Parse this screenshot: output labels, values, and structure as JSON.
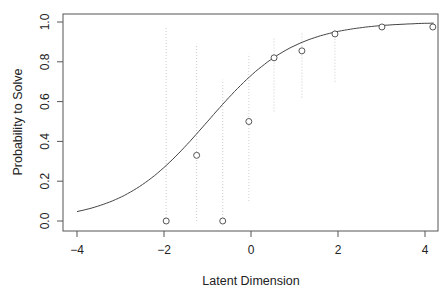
{
  "chart_data": {
    "type": "scatter",
    "title": "",
    "xlabel": "Latent Dimension",
    "ylabel": "Probability to Solve",
    "xlim": [
      -4.3,
      4.3
    ],
    "ylim": [
      -0.04,
      1.04
    ],
    "xticks": [
      -4,
      -2,
      0,
      2,
      4
    ],
    "xtick_labels": [
      "−4",
      "−2",
      "0",
      "2",
      "4"
    ],
    "yticks": [
      0.0,
      0.2,
      0.4,
      0.6,
      0.8,
      1.0
    ],
    "ytick_labels": [
      "0.0",
      "0.2",
      "0.4",
      "0.6",
      "0.8",
      "1.0"
    ],
    "grid": false,
    "legend": null,
    "points": [
      {
        "x": -1.95,
        "y": 0.0
      },
      {
        "x": -1.25,
        "y": 0.33
      },
      {
        "x": -0.65,
        "y": 0.0
      },
      {
        "x": -0.05,
        "y": 0.5
      },
      {
        "x": 0.53,
        "y": 0.82
      },
      {
        "x": 1.17,
        "y": 0.855
      },
      {
        "x": 1.93,
        "y": 0.94
      },
      {
        "x": 3.01,
        "y": 0.975
      },
      {
        "x": 4.18,
        "y": 0.975
      }
    ],
    "intervals": [
      {
        "x": -1.95,
        "low": 0.0,
        "high": 0.97
      },
      {
        "x": -1.25,
        "low": 0.0,
        "high": 0.89
      },
      {
        "x": -0.65,
        "low": 0.0,
        "high": 0.71
      },
      {
        "x": -0.05,
        "low": 0.1,
        "high": 0.84
      },
      {
        "x": 0.53,
        "low": 0.55,
        "high": 0.92
      },
      {
        "x": 1.17,
        "low": 0.62,
        "high": 0.95
      },
      {
        "x": 1.93,
        "low": 0.7,
        "high": 0.96
      }
    ],
    "curve": {
      "type": "logistic",
      "slope": 1.0,
      "location": -1.0,
      "x_range": [
        -4,
        4.2
      ]
    }
  }
}
